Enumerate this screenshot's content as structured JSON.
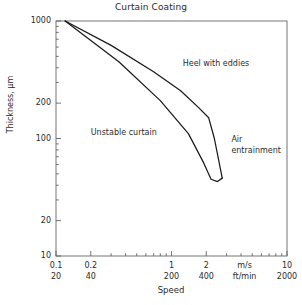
{
  "chart_data": {
    "type": "line",
    "title": "Curtain Coating",
    "xlabel": "Speed",
    "ylabel": "Thickness, μm",
    "xscale": "log",
    "yscale": "log",
    "xlim": [
      0.1,
      10
    ],
    "ylim": [
      10,
      1000
    ],
    "grid": false,
    "legend": "none",
    "x_unit_primary": "m/s",
    "x_unit_secondary": "ft/min",
    "x_ticks_primary": [
      "0.1",
      "0.2",
      "1",
      "2",
      "m/s",
      "10"
    ],
    "x_tick_values_primary": [
      0.1,
      0.2,
      1,
      2,
      null,
      10
    ],
    "x_ticks_secondary": [
      "20",
      "40",
      "200",
      "400",
      "ft/min",
      "2000"
    ],
    "x_tick_values_secondary": [
      20,
      40,
      200,
      400,
      null,
      2000
    ],
    "y_ticks": [
      "1000",
      "200",
      "100",
      "20",
      "10"
    ],
    "y_tick_values": [
      1000,
      200,
      100,
      20,
      10
    ],
    "series": [
      {
        "name": "Upper boundary (heel with eddies limit)",
        "points": [
          [
            0.12,
            1000
          ],
          [
            0.3,
            620
          ],
          [
            0.7,
            370
          ],
          [
            1.2,
            255
          ],
          [
            1.7,
            185
          ],
          [
            2.1,
            150
          ],
          [
            2.35,
            100
          ],
          [
            2.75,
            46
          ]
        ]
      },
      {
        "name": "Lower boundary (unstable curtain limit)",
        "points": [
          [
            0.12,
            1000
          ],
          [
            0.35,
            450
          ],
          [
            0.8,
            210
          ],
          [
            1.4,
            110
          ],
          [
            1.9,
            62
          ],
          [
            2.2,
            45
          ],
          [
            2.5,
            43
          ],
          [
            2.75,
            46
          ]
        ]
      }
    ],
    "annotations": [
      {
        "text": "Heel with eddies",
        "x": 1.25,
        "y": 430
      },
      {
        "text": "Unstable curtain",
        "x": 0.2,
        "y": 112
      },
      {
        "text": "Air",
        "x": 3.3,
        "y": 98
      },
      {
        "text": "entrainment",
        "x": 3.3,
        "y": 78
      }
    ]
  },
  "annotation_labels": {
    "heel_with_eddies": "Heel with eddies",
    "unstable_curtain": "Unstable curtain",
    "air": "Air",
    "entrainment": "entrainment"
  },
  "axis": {
    "title": "Curtain Coating",
    "x_title": "Speed",
    "y_title": "Thickness, μm",
    "y_tick_1000": "1000",
    "y_tick_200": "200",
    "y_tick_100": "100",
    "y_tick_20": "20",
    "y_tick_10": "10",
    "x_ms_0_1": "0.1",
    "x_ms_0_2": "0.2",
    "x_ms_1": "1",
    "x_ms_2": "2",
    "x_ms_unit": "m/s",
    "x_ms_10": "10",
    "x_ft_20": "20",
    "x_ft_40": "40",
    "x_ft_200": "200",
    "x_ft_400": "400",
    "x_ft_unit": "ft/min",
    "x_ft_2000": "2000"
  },
  "colors": {
    "axis": "#555555",
    "curve": "#1a1a1a",
    "text": "#2b2b2b",
    "background": "#ffffff"
  }
}
